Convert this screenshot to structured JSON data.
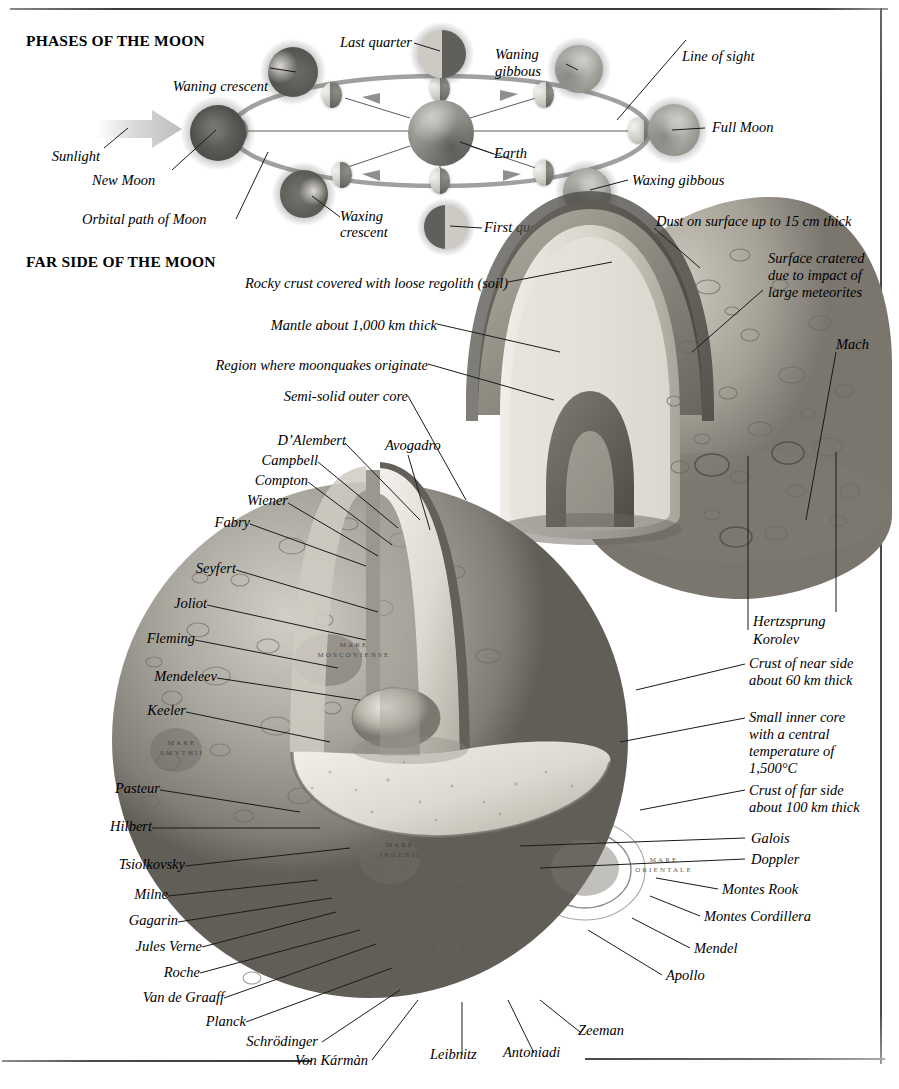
{
  "document": {
    "title": "The Moon — phases and far side structure",
    "sections": [
      {
        "heading": "PHASES OF THE MOON"
      },
      {
        "heading": "FAR SIDE OF THE MOON"
      }
    ]
  },
  "phases_panel": {
    "heading": "PHASES OF THE MOON",
    "labels": {
      "sunlight": "Sunlight",
      "new_moon": "New Moon",
      "orbital_path": "Orbital path of Moon",
      "waning_crescent": "Waning crescent",
      "last_quarter": "Last quarter",
      "waning_gibbous_l1": "Waning",
      "waning_gibbous_l2": "gibbous",
      "line_of_sight": "Line of sight",
      "full_moon": "Full Moon",
      "waxing_gibbous": "Waxing gibbous",
      "first_quarter": "First quarter",
      "waxing_crescent_l1": "Waxing",
      "waxing_crescent_l2": "crescent",
      "earth": "Earth"
    }
  },
  "farside_panel": {
    "heading": "FAR SIDE OF THE MOON",
    "structure_labels": {
      "dust": "Dust on surface up to 15 cm thick",
      "cratered_l1": "Surface cratered",
      "cratered_l2": "due to impact of",
      "cratered_l3": "large meteorites",
      "rocky_crust": "Rocky crust covered with loose regolith (soil)",
      "mantle": "Mantle about 1,000 km thick",
      "moonquakes": "Region where moonquakes originate",
      "outer_core": "Semi-solid outer core",
      "near_crust_l1": "Crust of near side",
      "near_crust_l2": "about 60 km thick",
      "inner_core_l1": "Small inner core",
      "inner_core_l2": "with a central",
      "inner_core_l3": "temperature of",
      "inner_core_l4": "1,500°C",
      "far_crust_l1": "Crust of far side",
      "far_crust_l2": "about 100 km thick"
    },
    "craters_left": [
      "D’Alembert",
      "Campbell",
      "Compton",
      "Wiener",
      "Fabry",
      "Seyfert",
      "Joliot",
      "Fleming",
      "Mendeleev",
      "Keeler",
      "Pasteur",
      "Hilbert",
      "Tsiolkovsky",
      "Milne",
      "Gagarin",
      "Jules Verne",
      "Roche",
      "Van de Graaff",
      "Planck",
      "Schrödinger",
      "Von Kármàn"
    ],
    "craters_top": [
      "Avogadro"
    ],
    "craters_right": [
      "Mach",
      "Hertzsprung",
      "Korolev",
      "Galois",
      "Doppler",
      "Montes Rook",
      "Montes Cordillera",
      "Mendel",
      "Apollo"
    ],
    "craters_bottom": [
      "Leibnitz",
      "Antoniadi",
      "Zeeman"
    ],
    "mare_names": [
      "MARE\nMOSCOVIENSE",
      "MARE\nSMYTHII",
      "MARE\nINGENII",
      "MARE\nORIENTALE"
    ]
  },
  "colors": {
    "ink": "#000000",
    "leader_line": "#1a1a1a",
    "rule": "#4a4a4a",
    "orbit_gray": "#9d9d9d",
    "regolith": "#8e897f",
    "mantle": "#d8d5cd",
    "core": "#b9b5ab",
    "page_bg": "#ffffff"
  }
}
